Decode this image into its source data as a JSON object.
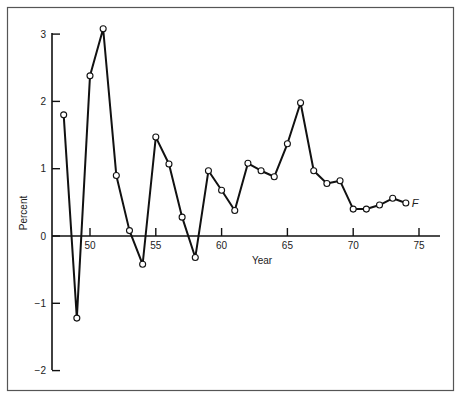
{
  "chart_data": {
    "type": "line",
    "title": "",
    "xlabel": "Year",
    "ylabel": "Percent",
    "xlim": [
      1947,
      1976
    ],
    "ylim": [
      -2,
      3
    ],
    "x_ticks": [
      "50",
      "55",
      "60",
      "65",
      "70",
      "75"
    ],
    "y_ticks": [
      "3",
      "2",
      "1",
      "0",
      "−1",
      "−2"
    ],
    "grid": false,
    "legend": null,
    "annotations": [
      {
        "text": "F",
        "x": 1974,
        "y": 0.49,
        "note": "final point labeled F (forecast)"
      }
    ],
    "series": [
      {
        "name": "Percent",
        "marker": "open-circle",
        "x": [
          1948,
          1949,
          1950,
          1951,
          1952,
          1953,
          1954,
          1955,
          1956,
          1957,
          1958,
          1959,
          1960,
          1961,
          1962,
          1963,
          1964,
          1965,
          1966,
          1967,
          1968,
          1969,
          1970,
          1971,
          1972,
          1973,
          1974
        ],
        "values": [
          1.8,
          -1.22,
          2.38,
          3.08,
          0.9,
          0.08,
          -0.42,
          1.47,
          1.07,
          0.28,
          -0.32,
          0.97,
          0.68,
          0.38,
          1.08,
          0.97,
          0.88,
          1.37,
          1.98,
          0.97,
          0.78,
          0.82,
          0.4,
          0.4,
          0.46,
          0.56,
          0.49
        ]
      }
    ]
  },
  "labels": {
    "xlabel": "Year",
    "ylabel": "Percent",
    "forecast_marker": "F",
    "x_ticks": [
      "50",
      "55",
      "60",
      "65",
      "70",
      "75"
    ],
    "y_ticks": [
      "3",
      "2",
      "1",
      "0",
      "−1",
      "−2"
    ]
  }
}
